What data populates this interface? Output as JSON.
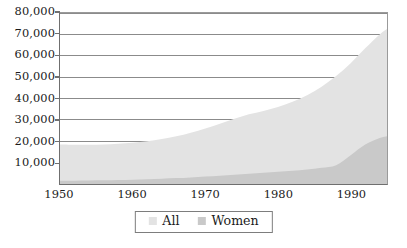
{
  "chart_data": {
    "type": "area",
    "title": "",
    "subtitle": "",
    "xlabel": "",
    "ylabel": "",
    "stacked": false,
    "grid": true,
    "grid_axis": "y",
    "legend_position": "bottom-center",
    "xlim": [
      1950,
      1995
    ],
    "ylim": [
      0,
      80000
    ],
    "x_tick_labels": [
      "1950",
      "1960",
      "1970",
      "1980",
      "1990"
    ],
    "x_ticks": [
      1950,
      1960,
      1970,
      1980,
      1990
    ],
    "y_tick_labels": [
      "10,000",
      "20,000",
      "30,000",
      "40,000",
      "50,000",
      "60,000",
      "70,000",
      "80,000"
    ],
    "y_ticks": [
      10000,
      20000,
      30000,
      40000,
      50000,
      60000,
      70000,
      80000
    ],
    "x": [
      1950,
      1952,
      1954,
      1956,
      1958,
      1960,
      1962,
      1964,
      1966,
      1968,
      1970,
      1972,
      1974,
      1976,
      1978,
      1980,
      1982,
      1984,
      1986,
      1988,
      1990,
      1992,
      1994,
      1995
    ],
    "series": [
      {
        "name": "All",
        "color": "#e3e3e3",
        "values": [
          18500,
          18400,
          18400,
          18500,
          18800,
          19300,
          20000,
          21000,
          22300,
          24000,
          26000,
          28200,
          30500,
          32600,
          34200,
          36000,
          38500,
          41500,
          45500,
          50500,
          56500,
          63500,
          70000,
          72500
        ]
      },
      {
        "name": "Women",
        "color": "#c9c9c9",
        "values": [
          1500,
          1550,
          1600,
          1700,
          1850,
          2000,
          2200,
          2450,
          2750,
          3100,
          3500,
          3900,
          4350,
          4800,
          5250,
          5700,
          6200,
          6800,
          7600,
          8800,
          13500,
          18500,
          21500,
          22300
        ]
      }
    ],
    "colors": {
      "all_fill": "#e3e3e3",
      "women_fill": "#c9c9c9",
      "gridline": "#8a8a8a",
      "axis": "#6f6f6f",
      "text": "#1b1b1b",
      "background": "#ffffff",
      "legend_border": "#7d7d7d"
    }
  },
  "legend": {
    "entries": [
      {
        "label": "All",
        "swatch_color": "#e3e3e3"
      },
      {
        "label": "Women",
        "swatch_color": "#c9c9c9"
      }
    ]
  }
}
